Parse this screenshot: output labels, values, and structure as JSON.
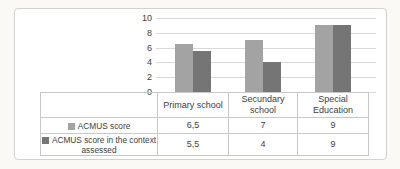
{
  "chart_data": {
    "type": "bar",
    "title": "",
    "xlabel": "",
    "ylabel": "",
    "categories": [
      "Primary school",
      "Secundary school",
      "Special Education"
    ],
    "series": [
      {
        "name": "ACMUS score",
        "color": "#a3a3a3",
        "values": [
          6.5,
          7,
          9
        ],
        "display_values": [
          "6,5",
          "7",
          "9"
        ]
      },
      {
        "name": "ACMUS score in the context assessed",
        "name_line1": "ACMUS score in the context",
        "name_line2": "assessed",
        "color": "#757575",
        "values": [
          5.5,
          4,
          9
        ],
        "display_values": [
          "5,5",
          "4",
          "9"
        ]
      }
    ],
    "ylim": [
      0,
      10
    ],
    "yticks": [
      0,
      2,
      4,
      6,
      8,
      10
    ],
    "grid": true,
    "legend_position": "data-table-left",
    "data_table": true
  },
  "colors": {
    "frame_border": "#d3d2cf",
    "gridline": "#d9d9d9",
    "table_border": "#c8c8c6",
    "text": "#404040",
    "chart_background": "#ffffff",
    "page_background": "#faf9f6"
  }
}
